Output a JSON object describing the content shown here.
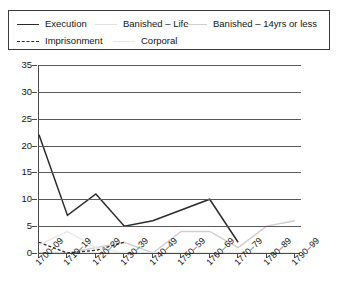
{
  "legend": {
    "position": "top",
    "rows": [
      [
        {
          "label": "Execution",
          "style": "solid-dark",
          "color": "#2b2b2b"
        },
        {
          "label": "Banished – Life",
          "style": "very-light",
          "color": "#e2e2e2"
        },
        {
          "label": "Banished – 14yrs or less",
          "style": "light-gray",
          "color": "#cfcfcf"
        }
      ],
      [
        {
          "label": "Imprisonment",
          "style": "dashed-dark",
          "color": "#2b2b2b"
        },
        {
          "label": "Corporal",
          "style": "pale",
          "color": "#e8e8e8"
        }
      ]
    ]
  },
  "chart_data": {
    "type": "line",
    "title": "",
    "subtitle": "",
    "xlabel": "",
    "ylabel": "",
    "grid": true,
    "ylim": [
      0,
      35
    ],
    "yticks": [
      0,
      5,
      10,
      15,
      20,
      25,
      30,
      35
    ],
    "categories": [
      "1700–09",
      "1710–19",
      "1720–29",
      "1730–39",
      "1740–49",
      "1750–59",
      "1760–69",
      "1770–79",
      "1780–89",
      "1790–99"
    ],
    "series": [
      {
        "name": "Execution",
        "color": "#2b2b2b",
        "dash": "none",
        "width": 1.5,
        "values": [
          22,
          7,
          11,
          5,
          6,
          8,
          10,
          2,
          null,
          null
        ]
      },
      {
        "name": "Banished – Life",
        "color": "#e2e2e2",
        "dash": "none",
        "width": 1.3,
        "values": [
          0,
          0,
          0,
          0,
          0,
          0,
          0,
          0,
          0,
          0
        ]
      },
      {
        "name": "Banished – 14yrs or less",
        "color": "#cfcfcf",
        "dash": "none",
        "width": 1.4,
        "values": [
          0,
          0,
          1,
          2,
          0,
          4,
          4,
          1,
          5,
          6
        ]
      },
      {
        "name": "Imprisonment",
        "color": "#2b2b2b",
        "dash": "3,2",
        "width": 1.3,
        "values": [
          2,
          0,
          0.5,
          2,
          null,
          null,
          null,
          null,
          null,
          null
        ]
      },
      {
        "name": "Corporal",
        "color": "#e8e8e8",
        "dash": "none",
        "width": 1.4,
        "values": [
          1.5,
          4,
          1,
          0,
          0,
          0,
          0,
          0,
          0,
          0
        ]
      }
    ]
  }
}
